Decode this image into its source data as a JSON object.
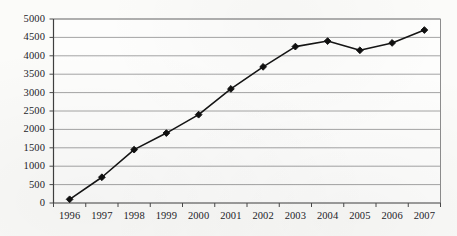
{
  "chart_data": {
    "type": "line",
    "title": "",
    "subtitle": "",
    "xlabel": "",
    "ylabel": "",
    "categories": [
      "1996",
      "1997",
      "1998",
      "1999",
      "2000",
      "2001",
      "2002",
      "2003",
      "2004",
      "2005",
      "2006",
      "2007"
    ],
    "values": [
      100,
      700,
      1450,
      1900,
      2400,
      3100,
      3700,
      4250,
      4400,
      4150,
      4350,
      4700
    ],
    "series": [
      {
        "name": "",
        "values": [
          100,
          700,
          1450,
          1900,
          2400,
          3100,
          3700,
          4250,
          4400,
          4150,
          4350,
          4700
        ]
      }
    ],
    "ylim": [
      0,
      5000
    ],
    "ytick_step": 500,
    "ytick_labels": [
      "0",
      "500",
      "1000",
      "1500",
      "2000",
      "2500",
      "3000",
      "3500",
      "4000",
      "4500",
      "5000"
    ],
    "ytick_values": [
      0,
      500,
      1000,
      1500,
      2000,
      2500,
      3000,
      3500,
      4000,
      4500,
      5000
    ],
    "grid": true,
    "grid_axis": "y",
    "legend": false,
    "legend_position": "none",
    "marker": "diamond",
    "annotations": [],
    "colors": {
      "line": "#151515",
      "marker": "#101010",
      "grid": "#9a9a9a",
      "axis": "#4a4a4a",
      "plot_background": "#fdfdfc",
      "page_background": "#fbfbf9",
      "tick_text": "#24242a"
    }
  },
  "axes": {
    "y_axis_name": "y-axis",
    "x_axis_name": "x-axis"
  }
}
